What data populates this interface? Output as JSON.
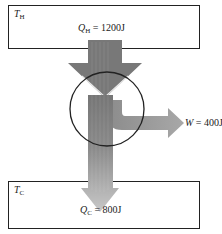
{
  "diagram": {
    "type": "heat-engine-energy-flow",
    "hot_reservoir": {
      "symbol": "T",
      "subscript": "H"
    },
    "cold_reservoir": {
      "symbol": "T",
      "subscript": "C"
    },
    "heat_in": {
      "symbol": "Q",
      "subscript": "H",
      "value": "= 1200J"
    },
    "work_out": {
      "symbol": "W",
      "value": "= 400J"
    },
    "heat_out": {
      "symbol": "Q",
      "subscript": "C",
      "value": "= 800J"
    }
  },
  "colors": {
    "hot_arrow": "#7a7a7a",
    "cold_arrow": "#c4c4c4",
    "work_arrow": "#a0a0a0",
    "outline": "#222222"
  }
}
